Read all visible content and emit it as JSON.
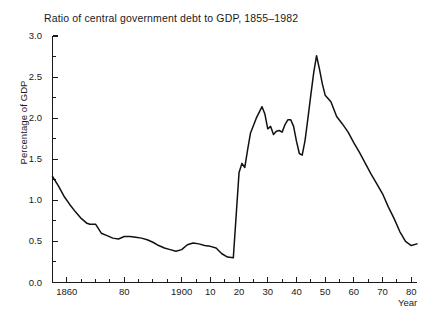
{
  "chart_data": {
    "type": "line",
    "title": "Ratio of central government debt to GDP, 1855–1982",
    "xlabel": "Year",
    "ylabel": "Percentage of GDP",
    "xlim": [
      1855,
      1982
    ],
    "ylim": [
      0.0,
      3.0
    ],
    "grid": false,
    "legend": "none",
    "y_ticks_major": [
      "0.0",
      "0.5",
      "1.0",
      "1.5",
      "2.0",
      "2.5",
      "3.0"
    ],
    "y_tick_values": [
      0.0,
      0.5,
      1.0,
      1.5,
      2.0,
      2.5,
      3.0
    ],
    "y_ticks_minor": [
      0.25,
      0.75,
      1.25,
      1.75,
      2.25,
      2.75
    ],
    "x_ticks_major": [
      {
        "value": 1860,
        "label": "1860"
      },
      {
        "value": 1880,
        "label": "80"
      },
      {
        "value": 1900,
        "label": "1900"
      },
      {
        "value": 1910,
        "label": "10"
      },
      {
        "value": 1920,
        "label": "20"
      },
      {
        "value": 1930,
        "label": "30"
      },
      {
        "value": 1940,
        "label": "40"
      },
      {
        "value": 1950,
        "label": "50"
      },
      {
        "value": 1960,
        "label": "60"
      },
      {
        "value": 1970,
        "label": "70"
      },
      {
        "value": 1980,
        "label": "80"
      }
    ],
    "x_ticks_minor": [
      1865,
      1870,
      1875,
      1885,
      1890,
      1895,
      1905,
      1915,
      1925,
      1935,
      1945,
      1955,
      1965,
      1975
    ],
    "series": [
      {
        "name": "Ratio of central government debt to GDP",
        "x": [
          1855,
          1857,
          1859,
          1861,
          1863,
          1865,
          1867,
          1868,
          1870,
          1872,
          1874,
          1876,
          1878,
          1880,
          1882,
          1884,
          1886,
          1888,
          1890,
          1892,
          1894,
          1896,
          1898,
          1900,
          1902,
          1904,
          1906,
          1908,
          1910,
          1912,
          1914,
          1916,
          1918,
          1920,
          1921,
          1922,
          1923,
          1924,
          1926,
          1928,
          1929,
          1930,
          1931,
          1932,
          1933,
          1934,
          1935,
          1936,
          1937,
          1938,
          1939,
          1940,
          1941,
          1942,
          1943,
          1944,
          1945,
          1946,
          1947,
          1948,
          1949,
          1950,
          1951,
          1952,
          1954,
          1956,
          1958,
          1960,
          1962,
          1964,
          1966,
          1968,
          1970,
          1972,
          1974,
          1976,
          1978,
          1980,
          1982
        ],
        "values": [
          1.29,
          1.18,
          1.05,
          0.95,
          0.86,
          0.78,
          0.72,
          0.71,
          0.71,
          0.6,
          0.57,
          0.54,
          0.53,
          0.56,
          0.56,
          0.55,
          0.54,
          0.52,
          0.49,
          0.45,
          0.42,
          0.4,
          0.38,
          0.4,
          0.46,
          0.48,
          0.47,
          0.45,
          0.44,
          0.42,
          0.35,
          0.31,
          0.3,
          1.34,
          1.45,
          1.4,
          1.62,
          1.82,
          2.0,
          2.14,
          2.05,
          1.87,
          1.9,
          1.8,
          1.84,
          1.85,
          1.83,
          1.92,
          1.98,
          1.98,
          1.9,
          1.72,
          1.57,
          1.55,
          1.73,
          2.0,
          2.28,
          2.55,
          2.76,
          2.6,
          2.42,
          2.28,
          2.24,
          2.2,
          2.02,
          1.93,
          1.83,
          1.7,
          1.58,
          1.45,
          1.32,
          1.2,
          1.08,
          0.92,
          0.78,
          0.62,
          0.5,
          0.45,
          0.47
        ]
      }
    ]
  },
  "axes": {
    "y_axis_name": "y-axis",
    "x_axis_name": "x-axis"
  }
}
